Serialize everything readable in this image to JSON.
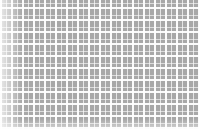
{
  "image": {
    "kind": "texture",
    "description": "woven grid pattern of white lines over gray squares",
    "colors": {
      "cell_gray": "#a8a8a8",
      "line_white": "#ffffff"
    },
    "cell_size_px": [
      11,
      12
    ]
  }
}
